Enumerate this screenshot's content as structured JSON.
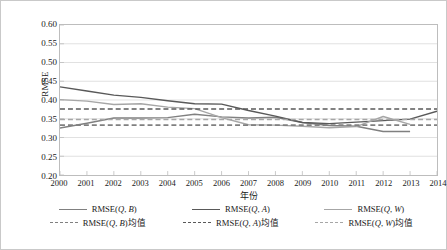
{
  "chart_data": {
    "type": "line",
    "title": "",
    "xlabel": "年份",
    "ylabel": "RMSE",
    "x": [
      2000,
      2001,
      2002,
      2003,
      2004,
      2005,
      2006,
      2007,
      2008,
      2009,
      2010,
      2011,
      2012,
      2013,
      2014
    ],
    "xlim": [
      2000,
      2014
    ],
    "ylim": [
      0.2,
      0.6
    ],
    "yticks": [
      "0.20",
      "0.25",
      "0.30",
      "0.35",
      "0.40",
      "0.45",
      "0.50",
      "0.55",
      "0.60"
    ],
    "xticks": [
      "2000",
      "2001",
      "2002",
      "2003",
      "2004",
      "2005",
      "2006",
      "2007",
      "2008",
      "2009",
      "2010",
      "2011",
      "2012",
      "2013",
      "2014"
    ],
    "grid": "horizontal",
    "legend_position": "bottom",
    "series": [
      {
        "name": "RMSE(Q, B)",
        "style": "solid",
        "color": "#808080",
        "x": [
          2000,
          2001,
          2002,
          2003,
          2004,
          2005,
          2006,
          2007,
          2008,
          2009,
          2010,
          2011,
          2012,
          2013
        ],
        "values": [
          0.325,
          0.338,
          0.352,
          0.352,
          0.353,
          0.362,
          0.355,
          0.352,
          0.354,
          0.34,
          0.332,
          0.33,
          0.316,
          0.316
        ]
      },
      {
        "name": "RMSE(Q, A)",
        "style": "solid",
        "color": "#595959",
        "x": [
          2000,
          2001,
          2002,
          2003,
          2004,
          2005,
          2006,
          2007,
          2008,
          2009,
          2010,
          2011,
          2012,
          2013,
          2014
        ],
        "values": [
          0.435,
          0.424,
          0.413,
          0.407,
          0.398,
          0.39,
          0.389,
          0.372,
          0.357,
          0.34,
          0.337,
          0.341,
          0.345,
          0.349,
          0.37
        ]
      },
      {
        "name": "RMSE(Q, W)",
        "style": "solid",
        "color": "#a6a6a6",
        "x": [
          2000,
          2001,
          2002,
          2003,
          2004,
          2005,
          2006,
          2007,
          2008,
          2009,
          2010,
          2011,
          2012,
          2013
        ],
        "values": [
          0.401,
          0.397,
          0.388,
          0.39,
          0.381,
          0.377,
          0.353,
          0.334,
          0.333,
          0.33,
          0.326,
          0.329,
          0.356,
          0.335
        ]
      },
      {
        "name": "RMSE(Q, B)均值",
        "style": "dashed",
        "color": "#808080",
        "constant": 0.333
      },
      {
        "name": "RMSE(Q, A)均值",
        "style": "dashed",
        "color": "#595959",
        "constant": 0.376
      },
      {
        "name": "RMSE(Q, W)均值",
        "style": "dashed",
        "color": "#a6a6a6",
        "constant": 0.348
      }
    ]
  },
  "axes": {
    "y_title": "RMSE",
    "x_title": "年份"
  },
  "legend": {
    "row1": [
      {
        "label": "RMSE(Q, B)",
        "color": "#808080",
        "style": "solid"
      },
      {
        "label": "RMSE(Q, A)",
        "color": "#595959",
        "style": "solid"
      },
      {
        "label": "RMSE(Q, W)",
        "color": "#a6a6a6",
        "style": "solid"
      }
    ],
    "row2": [
      {
        "label": "RMSE(Q, B)均值",
        "color": "#808080",
        "style": "dashed"
      },
      {
        "label": "RMSE(Q, A)均值",
        "color": "#595959",
        "style": "dashed"
      },
      {
        "label": "RMSE(Q, W)均值",
        "color": "#a6a6a6",
        "style": "dashed"
      }
    ]
  }
}
